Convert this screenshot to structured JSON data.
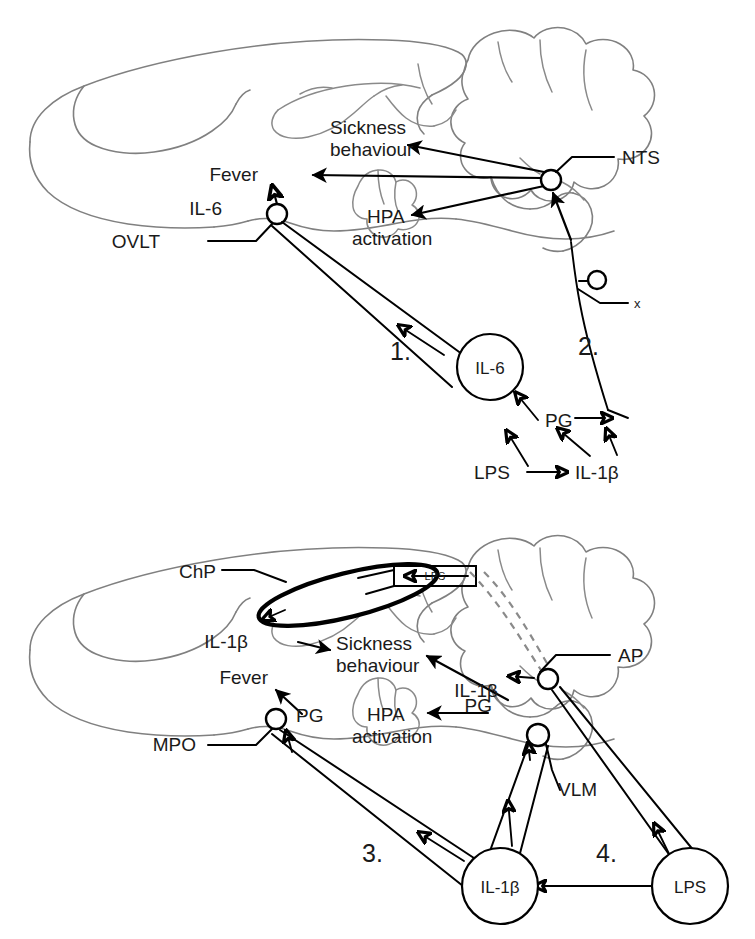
{
  "figure": {
    "type": "diagram",
    "panels": [
      {
        "id": "top",
        "pathways": [
          "1.",
          "2."
        ],
        "labels": [
          "Sickness behaviour",
          "Fever",
          "IL-6",
          "OVLT",
          "HPA activation",
          "NTS",
          "x",
          "IL-6",
          "PG",
          "LPS",
          "IL-1β",
          "1.",
          "2."
        ]
      },
      {
        "id": "bottom",
        "pathways": [
          "3.",
          "4."
        ],
        "labels": [
          "ChP",
          "LPS",
          "IL-1β",
          "Sickness behaviour",
          "Fever",
          "PG",
          "MPO",
          "HPA activation",
          "AP",
          "IL-1β",
          "PG",
          "VLM",
          "3.",
          "4.",
          "IL-1β",
          "LPS"
        ]
      }
    ]
  },
  "panel_top": {
    "sickness": "Sickness",
    "behaviour": "behaviour",
    "fever": "Fever",
    "il6_ovlt": "IL-6",
    "ovlt": "OVLT",
    "hpa": "HPA",
    "activation": "activation",
    "nts": "NTS",
    "vagus": "x",
    "num1": "1.",
    "num2": "2.",
    "circle_il6": "IL-6",
    "pg": "PG",
    "lps": "LPS",
    "il1b": "IL-1β"
  },
  "panel_bottom": {
    "chp": "ChP",
    "lps_box": "LPS",
    "il1b_chp": "IL-1β",
    "sickness": "Sickness",
    "behaviour": "behaviour",
    "fever": "Fever",
    "pg_mpo": "PG",
    "mpo": "MPO",
    "hpa": "HPA",
    "activation": "activation",
    "ap": "AP",
    "il1b_ap": "IL-1β",
    "pg_vlm": "PG",
    "vlm": "VLM",
    "num3": "3.",
    "num4": "4.",
    "circle_il1b": "IL-1β",
    "circle_lps": "LPS"
  },
  "style": {
    "brain_outline_color": "#808080",
    "arrow_color": "#000000",
    "dashed_color": "#8a8a8a",
    "background": "#ffffff"
  }
}
